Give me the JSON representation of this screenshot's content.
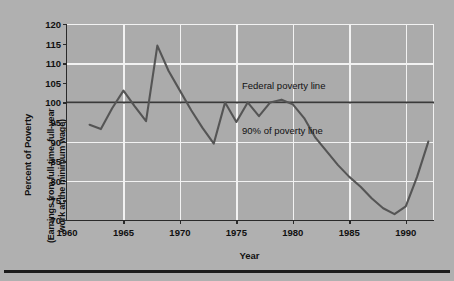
{
  "chart_data": {
    "type": "line",
    "title": "",
    "xlabel": "Year",
    "ylabel": "Percent of Poverty",
    "ylabel_sub_line1": "(Earnings from full-time, full-year",
    "ylabel_sub_line2": "work at the minimum wage)",
    "xlim": [
      1960,
      1992.5
    ],
    "ylim": [
      70,
      120
    ],
    "yticks": [
      70,
      75,
      80,
      85,
      90,
      95,
      100,
      105,
      110,
      115,
      120
    ],
    "xticks": [
      1960,
      1965,
      1970,
      1975,
      1980,
      1985,
      1990
    ],
    "xtick_labels": [
      "1960",
      "1965",
      "1970",
      "1975",
      "1980",
      "1985",
      "1990"
    ],
    "ytick_labels": [
      "70",
      "75",
      "80",
      "85",
      "90",
      "95",
      "100",
      "105",
      "110",
      "115",
      "120"
    ],
    "y_gridlines": [
      80,
      90,
      100,
      110,
      120
    ],
    "x_gridlines": [
      1965,
      1970,
      1975,
      1980,
      1985,
      1990
    ],
    "grid": true,
    "legend": "none",
    "background_color": "#ababab",
    "gridline_color": "#f2f2f2",
    "line_color": "#555555",
    "reference_line_color": "#3a3a3a",
    "annotations": [
      {
        "text": "Federal poverty line",
        "value": 100
      },
      {
        "text": "90% of poverty line",
        "value": 90
      }
    ],
    "reference_lines": [
      {
        "name": "federal-poverty-line",
        "y": 100
      }
    ],
    "series": [
      {
        "name": "Earnings as percent of poverty",
        "x": [
          1962,
          1963,
          1964,
          1965,
          1966,
          1967,
          1968,
          1969,
          1970,
          1971,
          1972,
          1973,
          1974,
          1975,
          1976,
          1977,
          1978,
          1979,
          1980,
          1981,
          1982,
          1983,
          1984,
          1985,
          1986,
          1987,
          1988,
          1989,
          1990,
          1991,
          1992
        ],
        "values": [
          94.3,
          93.2,
          98.5,
          103.0,
          99.0,
          95.2,
          114.5,
          108.0,
          103.0,
          98.0,
          93.5,
          89.5,
          100.0,
          95.0,
          100.0,
          96.5,
          100.0,
          100.7,
          99.5,
          96.0,
          91.0,
          87.5,
          84.0,
          81.0,
          78.5,
          75.5,
          73.0,
          71.5,
          73.5,
          81.0,
          90.0
        ]
      }
    ]
  }
}
